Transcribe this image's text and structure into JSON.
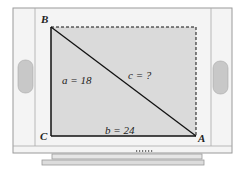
{
  "diagram": {
    "vertices": {
      "A": "A",
      "B": "B",
      "C": "C"
    },
    "sides": {
      "a": "a = 18",
      "b": "b = 24",
      "c": "c = ?"
    },
    "colors": {
      "screen": "#d9d9d9",
      "frame": "#f2f2f2",
      "speaker": "#c8c8c8",
      "line": "#111111"
    }
  }
}
